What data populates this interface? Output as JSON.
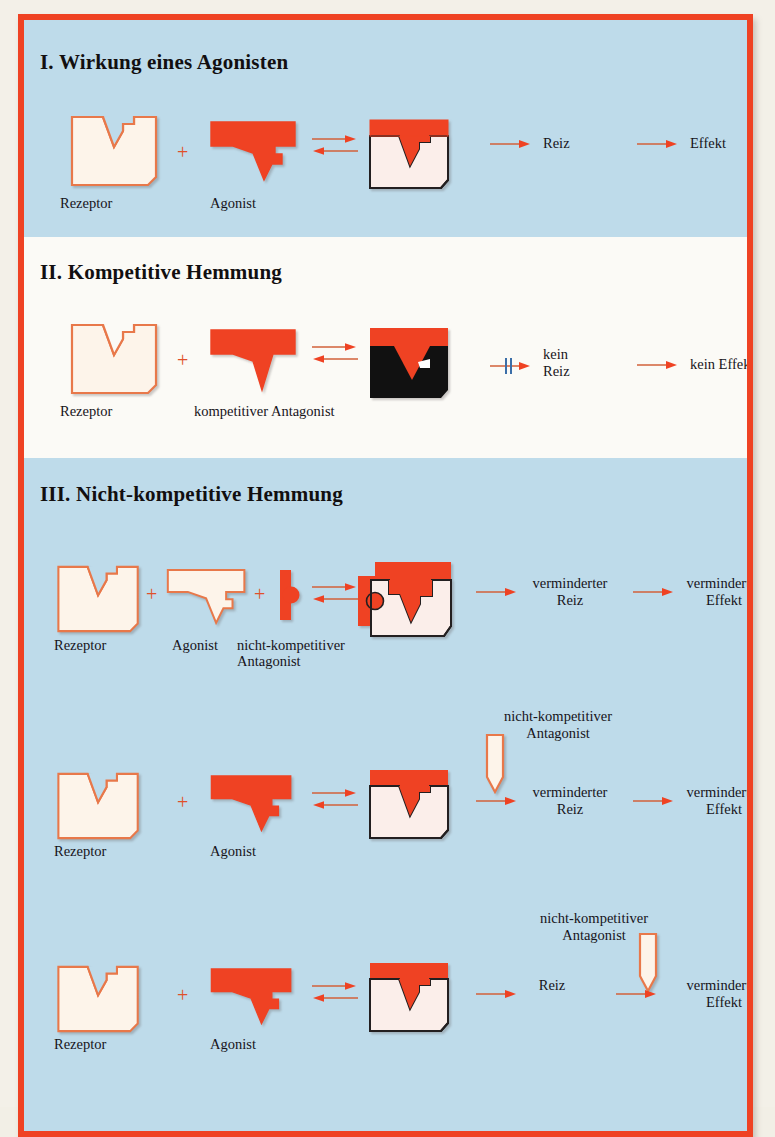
{
  "figure": {
    "colors": {
      "frame": "#ef4223",
      "panel_blue": "#bedbea",
      "panel_white": "#fbfaf6",
      "drug_red": "#ef4223",
      "receptor_fill": "#fdf4ea",
      "receptor_outline": "#e8784a",
      "complex_fill": "#fbeeea",
      "complex_outline": "#231f20",
      "blocked_bar": "#3b6ea8",
      "arrow": "#d2603a",
      "text": "#17141a",
      "antagonist_black": "#111111"
    }
  },
  "sections": [
    {
      "id": "I",
      "heading": "I. Wirkung eines Agonisten",
      "background": "blue",
      "rows": [
        {
          "labels": {
            "receptor": "Rezeptor",
            "ligand": "Agonist",
            "result_1": "Reiz",
            "result_2": "Effekt"
          },
          "operators": {
            "plus": "+",
            "equilibrium": "⇌"
          }
        }
      ]
    },
    {
      "id": "II",
      "heading": "II. Kompetitive Hemmung",
      "background": "white",
      "rows": [
        {
          "labels": {
            "receptor": "Rezeptor",
            "ligand": "kompetitiver Antagonist",
            "result_1": "kein\nReiz",
            "result_1_line1": "kein",
            "result_1_line2": "Reiz",
            "result_2": "kein Effekt"
          },
          "operators": {
            "plus": "+",
            "equilibrium": "⇌",
            "blocked": "⫫"
          }
        }
      ]
    },
    {
      "id": "III",
      "heading": "III. Nicht-kompetitive Hemmung",
      "background": "blue",
      "rows": [
        {
          "labels": {
            "receptor": "Rezeptor",
            "ligand": "Agonist",
            "antagonist_line1": "nicht-kompetitiver",
            "antagonist_line2": "Antagonist",
            "result_1_line1": "verminderter",
            "result_1_line2": "Reiz",
            "result_2_line1": "verminderter",
            "result_2_line2": "Effekt"
          },
          "operators": {
            "plus": "+",
            "plus2": "+",
            "equilibrium": "⇌"
          }
        },
        {
          "labels": {
            "receptor": "Rezeptor",
            "ligand": "Agonist",
            "antagonist_line1": "nicht-kompetitiver",
            "antagonist_line2": "Antagonist",
            "result_1_line1": "verminderter",
            "result_1_line2": "Reiz",
            "result_2_line1": "verminderter",
            "result_2_line2": "Effekt"
          },
          "operators": {
            "plus": "+",
            "equilibrium": "⇌"
          }
        },
        {
          "labels": {
            "receptor": "Rezeptor",
            "ligand": "Agonist",
            "antagonist_line1": "nicht-kompetitiver",
            "antagonist_line2": "Antagonist",
            "result_1_line1": "Reiz",
            "result_1_line2": "",
            "result_2_line1": "verminderter",
            "result_2_line2": "Effekt"
          },
          "operators": {
            "plus": "+",
            "equilibrium": "⇌"
          }
        }
      ]
    }
  ]
}
